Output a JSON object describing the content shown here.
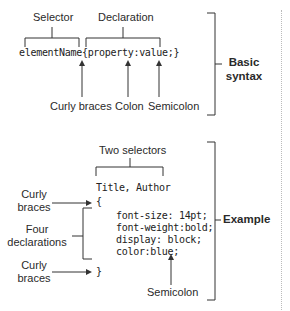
{
  "basic": {
    "selector_label": "Selector",
    "declaration_label": "Declaration",
    "code": "elementName{property:value;}",
    "curly_label": "Curly braces",
    "colon_label": "Colon",
    "semicolon_label": "Semicolon",
    "section_label_line1": "Basic",
    "section_label_line2": "syntax"
  },
  "example": {
    "two_selectors_label": "Two selectors",
    "selector_code": "Title, Author",
    "open_brace": "{",
    "declarations": [
      "font-size: 14pt;",
      "font-weight:bold;",
      "display: block;",
      "color:blue;"
    ],
    "close_brace": "}",
    "curly_top_line1": "Curly",
    "curly_top_line2": "braces",
    "four_line1": "Four",
    "four_line2": "declarations",
    "curly_bottom_line1": "Curly",
    "curly_bottom_line2": "braces",
    "semicolon_label": "Semicolon",
    "section_label": "Example"
  }
}
